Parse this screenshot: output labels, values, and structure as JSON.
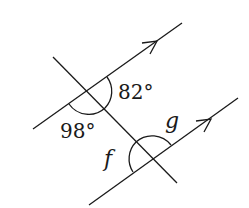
{
  "diagram": {
    "type": "parallel-lines-transversal",
    "labels": {
      "angle_upper_right": "82°",
      "angle_upper_left_below": "98°",
      "angle_f": "f",
      "angle_g": "g"
    },
    "colors": {
      "stroke": "#1a1a1a",
      "background": "#ffffff"
    }
  }
}
